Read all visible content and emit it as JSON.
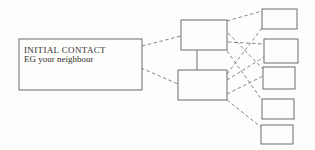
{
  "diagram": {
    "type": "flow-diagram",
    "nodes": {
      "initial_contact": {
        "line1": "INITIAL CONTACT",
        "line2": "EG your neighbour"
      },
      "stage_top": {
        "label": ""
      },
      "stage_bottom": {
        "label": ""
      },
      "option_1": {
        "label": ""
      },
      "option_2": {
        "label": ""
      },
      "option_3": {
        "label": ""
      },
      "option_4": {
        "label": ""
      },
      "option_5": {
        "label": ""
      }
    },
    "edges": [
      {
        "from": "initial_contact",
        "to": "stage_top",
        "style": "dashed"
      },
      {
        "from": "initial_contact",
        "to": "stage_bottom",
        "style": "dashed"
      },
      {
        "from": "stage_top",
        "to": "stage_bottom",
        "style": "solid"
      },
      {
        "from": "stage_top",
        "to": "option_1",
        "style": "dashed"
      },
      {
        "from": "stage_top",
        "to": "option_2",
        "style": "dashed"
      },
      {
        "from": "stage_top",
        "to": "option_3",
        "style": "dashed"
      },
      {
        "from": "stage_top",
        "to": "option_4",
        "style": "dashed"
      },
      {
        "from": "stage_bottom",
        "to": "option_1",
        "style": "dashed"
      },
      {
        "from": "stage_bottom",
        "to": "option_2",
        "style": "dashed"
      },
      {
        "from": "stage_bottom",
        "to": "option_3",
        "style": "dashed"
      },
      {
        "from": "stage_bottom",
        "to": "option_5",
        "style": "dashed"
      }
    ],
    "colors": {
      "box_stroke": "#5d5d5d",
      "edge_stroke": "#6a6a6a",
      "text": "#34302b",
      "background": "#fdfdfc"
    }
  }
}
